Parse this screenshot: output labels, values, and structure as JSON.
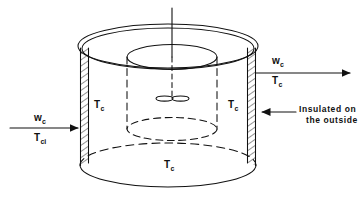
{
  "figure": {
    "type": "engineering-schematic",
    "line_color": "#111111",
    "background_color": "#ffffff"
  },
  "labels": {
    "inlet_flow": "w",
    "inlet_flow_sub": "c",
    "inlet_temp": "T",
    "inlet_temp_sub": "ci",
    "outlet_flow": "w",
    "outlet_flow_sub": "c",
    "outlet_temp": "T",
    "outlet_temp_sub": "c",
    "wall_left_temp": "T",
    "wall_left_temp_sub": "c",
    "wall_right_temp": "T",
    "wall_right_temp_sub": "c",
    "bottom_temp": "T",
    "bottom_temp_sub": "c",
    "insulation_note_line1": "Insulated on",
    "insulation_note_line2": "the outside"
  },
  "parts": {
    "tank_shell": "tank-shell",
    "tank_top_rim": "tank-top-rim",
    "tank_bottom": "tank-bottom",
    "wall_left": "insulated-wall-left",
    "wall_right": "insulated-wall-right",
    "draft_tube": "draft-tube",
    "agitator_shaft": "agitator-shaft",
    "impeller": "impeller",
    "inlet_arrow": "inlet-arrow",
    "outlet_arrow": "outlet-arrow",
    "insulation_pointer": "insulation-pointer-arrow"
  }
}
